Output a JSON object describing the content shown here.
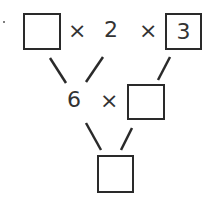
{
  "diagram": {
    "type": "multiplication-pyramid",
    "top_row": {
      "box_left": "",
      "op1": "×",
      "value_middle": "2",
      "op2": "×",
      "box_right": "3"
    },
    "middle_row": {
      "value_left": "6",
      "op": "×",
      "box_right": ""
    },
    "bottom_row": {
      "box": ""
    },
    "line_color": "#2a2a2a"
  }
}
